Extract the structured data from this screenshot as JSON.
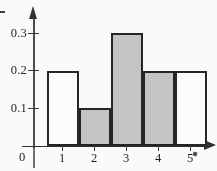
{
  "chart_data": {
    "type": "bar",
    "title": "",
    "subtitle": "",
    "xlabel": "",
    "ylabel": "",
    "categories": [
      "1",
      "2",
      "3",
      "4",
      "5"
    ],
    "values": [
      0.2,
      0.1,
      0.3,
      0.2,
      0.2
    ],
    "bar_styles": [
      "empty",
      "filled",
      "filled",
      "filled",
      "empty"
    ],
    "bar_fill_color": "#c6c6c6",
    "bar_outline_color": "#232323",
    "axis_color": "#2b2b2b",
    "grid": false,
    "legend": null,
    "xlim": [
      0.5,
      5.5
    ],
    "ylim": [
      0,
      0.35
    ],
    "y_ticks": [
      "0.3",
      "0.2",
      "0.1"
    ],
    "y_tick_values": [
      0.3,
      0.2,
      0.1
    ],
    "x_ticks": [
      "1",
      "2",
      "3",
      "4",
      "5"
    ],
    "origin_label": "0",
    "bar_width": 1,
    "annotations": []
  },
  "axes": {
    "y_axis_name": "vertical-axis",
    "x_axis_name": "horizontal-axis",
    "y_arrow": "up-arrow-icon",
    "x_arrow": "right-arrow-icon"
  }
}
